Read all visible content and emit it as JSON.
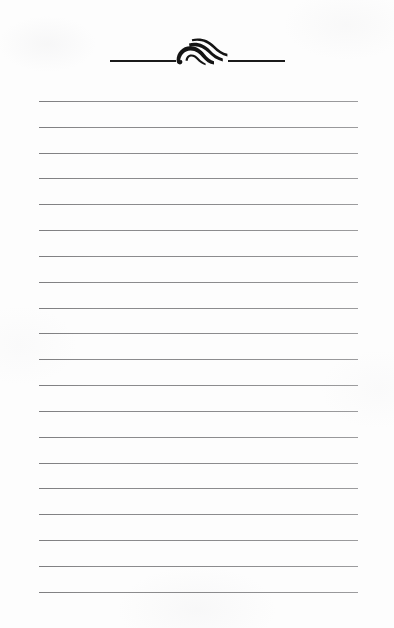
{
  "document": {
    "kind": "lined-notepaper-scan",
    "page_width": 394,
    "page_height": 628,
    "background_color": "#fdfdfd",
    "ink_color": "#1b1b1b",
    "rule_color": "#8a8a8c",
    "text_content": "",
    "header": {
      "ornament_name": "wave-flourish-ornament",
      "ornament_description": "stylized curled wave with three tapering tails",
      "rule_left": {
        "x": 110,
        "y": 60,
        "width": 66,
        "height": 2
      },
      "rule_right": {
        "x": 228,
        "y": 60,
        "width": 57,
        "height": 2
      }
    },
    "ruled_lines": {
      "count": 20,
      "left_x": 39,
      "right_x": 358,
      "width": 319,
      "first_y": 101,
      "spacing": 25.85,
      "thickness": 1,
      "y_positions": [
        101,
        127,
        153,
        178,
        204,
        230,
        256,
        282,
        308,
        333,
        359,
        385,
        411,
        437,
        463,
        488,
        514,
        540,
        566,
        592
      ]
    }
  }
}
